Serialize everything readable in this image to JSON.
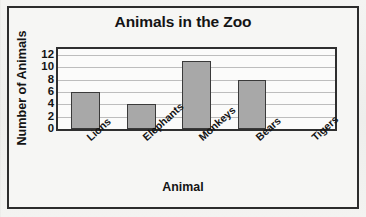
{
  "chart_data": {
    "type": "bar",
    "title": "Animals in the Zoo",
    "xlabel": "Animal",
    "ylabel": "Number of Animals",
    "categories": [
      "Lions",
      "Elephants",
      "Monkeys",
      "Bears",
      "Tigers"
    ],
    "values": [
      6,
      4,
      11,
      8,
      0
    ],
    "yticks": [
      12,
      10,
      8,
      6,
      4,
      2,
      0
    ],
    "ylim": [
      0,
      13
    ],
    "grid": true,
    "legend": null,
    "colors": {
      "bar_fill": "#a8a8a8",
      "bar_stroke": "#3a3a3a",
      "plot_background": "#fbfbfa",
      "page_background": "#f2f2f0",
      "frame": "#2c2c2c",
      "gridline": "#bdbdbd",
      "text": "#141414"
    }
  }
}
